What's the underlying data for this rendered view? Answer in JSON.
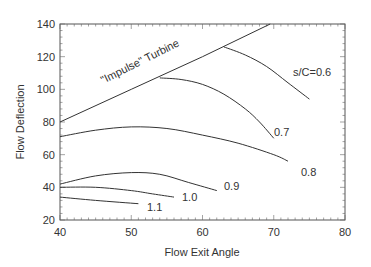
{
  "chart_data": {
    "type": "line",
    "title": "",
    "xlabel": "Flow Exit Angle",
    "ylabel": "Flow Deflection",
    "xlim": [
      40,
      80
    ],
    "ylim": [
      20,
      140
    ],
    "xticks": [
      40,
      50,
      60,
      70,
      80
    ],
    "yticks": [
      20,
      40,
      60,
      80,
      100,
      120,
      140
    ],
    "grid": false,
    "legend": "none (inline curve labels)",
    "series": [
      {
        "name": "\"Impulse\" Turbine",
        "label": "\"Impulse\" Turbine",
        "x": [
          40,
          50,
          60,
          69.5
        ],
        "y": [
          80,
          100,
          120,
          140
        ]
      },
      {
        "name": "s/C=0.6",
        "label": "s/C=0.6",
        "x": [
          63,
          66,
          69,
          72,
          75
        ],
        "y": [
          126,
          121,
          114,
          104,
          94
        ]
      },
      {
        "name": "s/C=0.7",
        "label": "0.7",
        "x": [
          54,
          57,
          60,
          63,
          66,
          68,
          70
        ],
        "y": [
          107,
          106,
          103,
          97,
          88,
          80,
          70
        ]
      },
      {
        "name": "s/C=0.8",
        "label": "0.8",
        "x": [
          40,
          45,
          50,
          55,
          60,
          65,
          70,
          72
        ],
        "y": [
          71,
          75,
          77,
          76,
          72,
          67,
          60,
          56
        ]
      },
      {
        "name": "s/C=0.9",
        "label": "0.9",
        "x": [
          40,
          45,
          50,
          54,
          58,
          62
        ],
        "y": [
          42,
          47,
          49,
          48,
          43,
          38
        ]
      },
      {
        "name": "s/C=1.0",
        "label": "1.0",
        "x": [
          40,
          45,
          50,
          53,
          56
        ],
        "y": [
          40,
          40,
          38,
          36,
          34
        ]
      },
      {
        "name": "s/C=1.1",
        "label": "1.1",
        "x": [
          40,
          45,
          51
        ],
        "y": [
          34,
          32,
          30
        ]
      }
    ],
    "annotations": [
      "\"Impulse\" Turbine",
      "s/C=0.6",
      "0.7",
      "0.8",
      "0.9",
      "1.0",
      "1.1"
    ]
  },
  "axes": {
    "x_label": "Flow Exit Angle",
    "y_label": "Flow Deflection"
  },
  "colors": {
    "line": "#333333",
    "background": "#ffffff"
  }
}
